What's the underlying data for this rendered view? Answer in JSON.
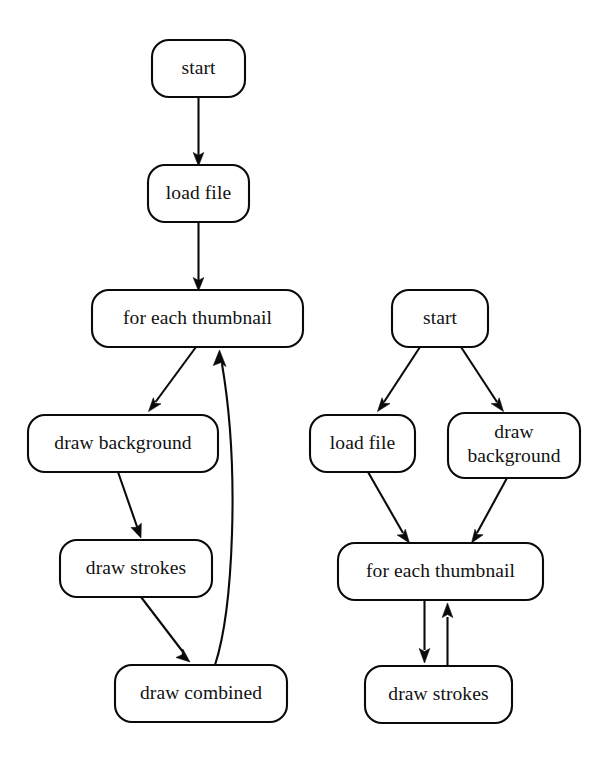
{
  "page": {
    "background_color": "#ffffff",
    "stroke_color": "#0a0a0a",
    "node_fill": "#ffffff",
    "width": 613,
    "height": 769
  },
  "diagrams": [
    {
      "id": "left-flowchart",
      "name": "left-flowchart",
      "nodes": [
        {
          "id": "l-start",
          "label": "start",
          "label_line1": "start",
          "label_line2": ""
        },
        {
          "id": "l-load",
          "label": "load file",
          "label_line1": "load file",
          "label_line2": ""
        },
        {
          "id": "l-foreach",
          "label": "for each thumbnail",
          "label_line1": "for each thumbnail",
          "label_line2": ""
        },
        {
          "id": "l-drawbg",
          "label": "draw background",
          "label_line1": "draw background",
          "label_line2": ""
        },
        {
          "id": "l-strokes",
          "label": "draw strokes",
          "label_line1": "draw strokes",
          "label_line2": ""
        },
        {
          "id": "l-combined",
          "label": "draw combined",
          "label_line1": "draw combined",
          "label_line2": ""
        }
      ],
      "edges": [
        {
          "from": "l-start",
          "to": "l-load",
          "kind": "straight-down"
        },
        {
          "from": "l-load",
          "to": "l-foreach",
          "kind": "straight-down"
        },
        {
          "from": "l-foreach",
          "to": "l-drawbg",
          "kind": "diagonal-down-left"
        },
        {
          "from": "l-drawbg",
          "to": "l-strokes",
          "kind": "diagonal-down-left"
        },
        {
          "from": "l-strokes",
          "to": "l-combined",
          "kind": "diagonal-down-right"
        },
        {
          "from": "l-combined",
          "to": "l-foreach",
          "kind": "loop-back-curve"
        }
      ]
    },
    {
      "id": "right-flowchart",
      "name": "right-flowchart",
      "nodes": [
        {
          "id": "r-start",
          "label": "start",
          "label_line1": "start",
          "label_line2": ""
        },
        {
          "id": "r-load",
          "label": "load file",
          "label_line1": "load file",
          "label_line2": ""
        },
        {
          "id": "r-drawbg",
          "label": "draw background",
          "label_line1": "draw",
          "label_line2": "background"
        },
        {
          "id": "r-foreach",
          "label": "for each thumbnail",
          "label_line1": "for each thumbnail",
          "label_line2": ""
        },
        {
          "id": "r-strokes",
          "label": "draw strokes",
          "label_line1": "draw strokes",
          "label_line2": ""
        }
      ],
      "edges": [
        {
          "from": "r-start",
          "to": "r-load",
          "kind": "diagonal-down-left"
        },
        {
          "from": "r-start",
          "to": "r-drawbg",
          "kind": "diagonal-down-right"
        },
        {
          "from": "r-load",
          "to": "r-foreach",
          "kind": "diagonal-down-right"
        },
        {
          "from": "r-drawbg",
          "to": "r-foreach",
          "kind": "diagonal-down-left"
        },
        {
          "from": "r-foreach",
          "to": "r-strokes",
          "kind": "straight-down"
        },
        {
          "from": "r-strokes",
          "to": "r-foreach",
          "kind": "straight-up"
        }
      ]
    }
  ]
}
